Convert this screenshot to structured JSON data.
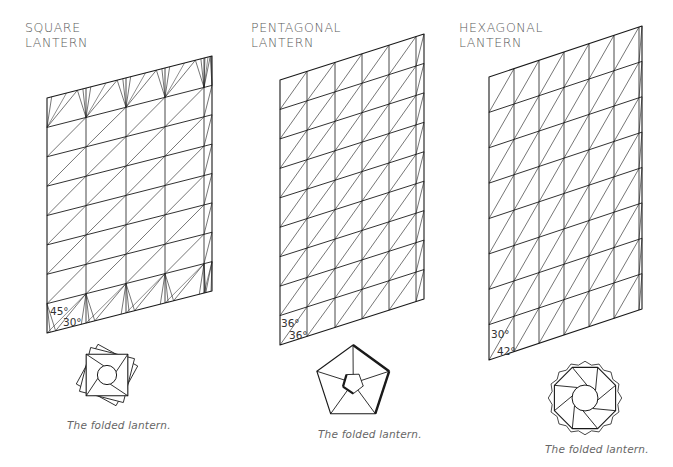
{
  "colors": {
    "line": "#1a1a1a",
    "text": "#5a5a5a",
    "caption": "#666666",
    "background": "#ffffff"
  },
  "panels": [
    {
      "id": "square",
      "title_line1": "SQUARE",
      "title_line2": "LANTERN",
      "caption": "The folded lantern.",
      "angles": [
        "45°",
        "30°"
      ],
      "grid": {
        "top_left": [
          47,
          98
        ],
        "top_right": [
          212,
          56
        ],
        "bottom_left": [
          47,
          333
        ],
        "columns_x": [
          47,
          86,
          126,
          165,
          204,
          212
        ],
        "rows": 8,
        "special_edge_rows": true
      },
      "folded_shape": {
        "type": "square",
        "center": [
          107,
          375
        ],
        "sides": 4,
        "radius": 32
      }
    },
    {
      "id": "pentagonal",
      "title_line1": "PENTAGONAL",
      "title_line2": "LANTERN",
      "caption": "The folded lantern.",
      "angles": [
        "36°",
        "36°"
      ],
      "grid": {
        "top_left": [
          280,
          80
        ],
        "top_right": [
          424,
          34
        ],
        "bottom_left": [
          280,
          345
        ],
        "columns_x": [
          280,
          307,
          335,
          362,
          389,
          416,
          424
        ],
        "rows": 9,
        "special_edge_rows": false
      },
      "folded_shape": {
        "type": "pentagon",
        "center": [
          353,
          383
        ],
        "sides": 5,
        "radius": 38
      }
    },
    {
      "id": "hexagonal",
      "title_line1": "HEXAGONAL",
      "title_line2": "LANTERN",
      "caption": "The folded lantern.",
      "angles": [
        "30°",
        "42°"
      ],
      "grid": {
        "top_left": [
          489,
          77
        ],
        "top_right": [
          642,
          26
        ],
        "bottom_left": [
          489,
          360
        ],
        "columns_x": [
          489,
          514,
          539,
          564,
          589,
          614,
          639,
          642
        ],
        "rows": 8,
        "special_edge_rows": false
      },
      "folded_shape": {
        "type": "octagon",
        "center": [
          585,
          398
        ],
        "sides": 8,
        "radius": 36
      }
    }
  ]
}
